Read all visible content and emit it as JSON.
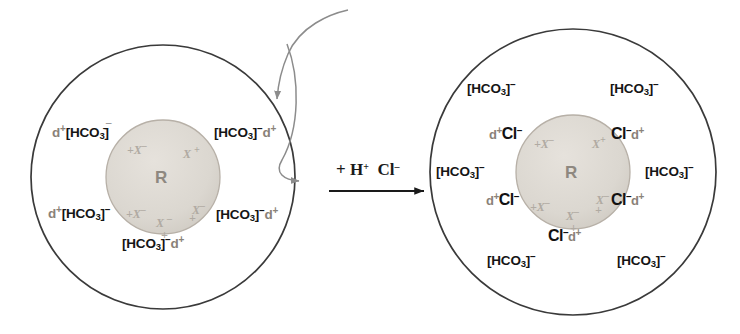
{
  "figure": {
    "type": "schematic-diagram"
  },
  "colors": {
    "shell_stroke": "#3a3a3a",
    "core_fill": "#dcd8d2",
    "core_stroke": "#b7b0a7",
    "core_text": "#8e8880",
    "x_mark": "#b0aaa2",
    "delta_plus": "#8a8279",
    "anion_text": "#151515",
    "arrow_gray": "#8c8c8c",
    "reaction_black": "#1a1a1a",
    "background": "#ffffff"
  },
  "glyphs": {
    "minus": "–",
    "plus": "+",
    "delta": "d",
    "bracket_open": "[",
    "bracket_close": "]",
    "bicarbonate": "HCO",
    "bicarbonate_sub": "3",
    "chloride": "Cl",
    "core_label": "R",
    "x_ion": "X",
    "x_ion_charge": "–"
  },
  "left_panel": {
    "name": "bicarbonate-form-bead",
    "core_label": "R",
    "core_x_marks": [
      {
        "text": "X",
        "charge": "–"
      },
      {
        "text": "X",
        "charge": "+"
      },
      {
        "text": "X",
        "charge": "–"
      },
      {
        "text": "X",
        "charge": "–"
      },
      {
        "text": "X",
        "charge": "+"
      },
      {
        "text": "X",
        "charge": "+"
      }
    ],
    "ion_pairs": [
      {
        "id": "upper-left",
        "order": "delta-first",
        "delta": "d",
        "delta_charge": "+",
        "anion": "[HCO3]",
        "anion_charge": "–"
      },
      {
        "id": "upper-right",
        "order": "anion-first",
        "delta": "d",
        "delta_charge": "+",
        "anion": "[HCO3]",
        "anion_charge": "–"
      },
      {
        "id": "lower-left",
        "order": "delta-first",
        "delta": "d",
        "delta_charge": "+",
        "anion": "[HCO3]",
        "anion_charge": "–"
      },
      {
        "id": "lower-right",
        "order": "anion-first",
        "delta": "d",
        "delta_charge": "+",
        "anion": "[HCO3]",
        "anion_charge": "–"
      },
      {
        "id": "bottom",
        "order": "anion-first",
        "delta": "d",
        "delta_charge": "+",
        "anion": "[HCO3]",
        "anion_charge": "–"
      }
    ]
  },
  "reaction": {
    "name": "reaction-condition",
    "reagent_plus": "+",
    "reagent_acid": "H",
    "reagent_acid_charge": "+",
    "reagent_anion": "Cl",
    "reagent_anion_charge": "–",
    "arrow": "→",
    "full_text": "+ H+ Cl–"
  },
  "right_panel": {
    "name": "chloride-form-bead",
    "core_label": "R",
    "core_x_marks": [
      {
        "text": "X",
        "charge": "–"
      },
      {
        "text": "X",
        "charge": "+"
      },
      {
        "text": "X",
        "charge": "–"
      },
      {
        "text": "X",
        "charge": "–"
      },
      {
        "text": "X",
        "charge": "–"
      },
      {
        "text": "X",
        "charge": "+"
      }
    ],
    "bound_pairs": [
      {
        "id": "upper-left",
        "order": "delta-first",
        "delta": "d",
        "delta_charge": "+",
        "anion": "Cl",
        "anion_charge": "–"
      },
      {
        "id": "upper-right",
        "order": "anion-first",
        "delta": "d",
        "delta_charge": "+",
        "anion": "Cl",
        "anion_charge": "–"
      },
      {
        "id": "lower-left",
        "order": "delta-first",
        "delta": "d",
        "delta_charge": "+",
        "anion": "Cl",
        "anion_charge": "–"
      },
      {
        "id": "lower-right",
        "order": "anion-first",
        "delta": "d",
        "delta_charge": "+",
        "anion": "Cl",
        "anion_charge": "–"
      },
      {
        "id": "bottom",
        "order": "anion-first",
        "delta": "d",
        "delta_charge": "+",
        "anion": "Cl",
        "anion_charge": "–"
      }
    ],
    "free_anions": [
      {
        "id": "top-left",
        "anion": "[HCO3]",
        "anion_charge": "–"
      },
      {
        "id": "top-right",
        "anion": "[HCO3]",
        "anion_charge": "–"
      },
      {
        "id": "mid-left",
        "anion": "[HCO3]",
        "anion_charge": "–"
      },
      {
        "id": "mid-right",
        "anion": "[HCO3]",
        "anion_charge": "–"
      },
      {
        "id": "bottom-left",
        "anion": "[HCO3]",
        "anion_charge": "–"
      },
      {
        "id": "bottom-right",
        "anion": "[HCO3]",
        "anion_charge": "–"
      }
    ]
  },
  "annotations": {
    "curved_arrow_in": {
      "name": "incoming-ion-arrow",
      "direction": "down"
    },
    "curved_arrow_out": {
      "name": "outgoing-ion-arrow",
      "direction": "right"
    }
  }
}
